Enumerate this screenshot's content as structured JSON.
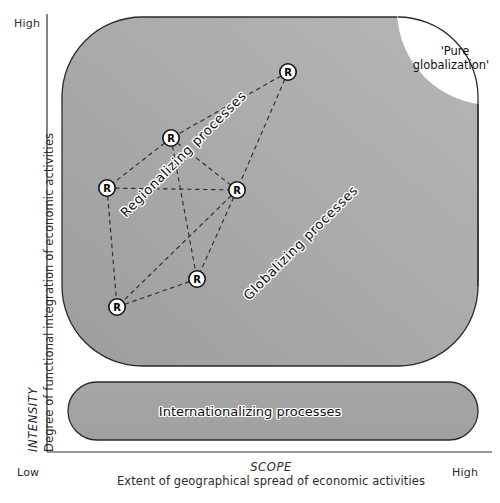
{
  "figure": {
    "background_color": "#ffffff",
    "shape_fill": "#a9a9a9",
    "shape_stroke": "#2b2b2b",
    "node_fill": "#ffffff",
    "node_stroke": "#111111",
    "edge_color": "#2e2e2e"
  },
  "axes": {
    "y": {
      "title_italic": "INTENSITY",
      "title_sub": "Degree of functional integration of economic activities",
      "high_label": "High",
      "low_label": "Low"
    },
    "x": {
      "title_italic": "SCOPE",
      "title_sub": "Extent of geographical spread of economic activities",
      "low_label": "Low",
      "high_label": "High"
    }
  },
  "regions": {
    "main_shape": {
      "label_globalizing": "Globalizing  processes",
      "label_regionalizing": "Regionalizing  processes",
      "pure_globalization_line1": "'Pure",
      "pure_globalization_line2": "globalization'"
    },
    "bottom_shape": {
      "label": "Internationalizing processes"
    }
  },
  "network": {
    "node_letter": "R",
    "node_count": 6,
    "nodes": [
      {
        "id": "r1",
        "letter": "R",
        "x": 288,
        "y": 72
      },
      {
        "id": "r2",
        "letter": "R",
        "x": 171,
        "y": 138
      },
      {
        "id": "r3",
        "letter": "R",
        "x": 107,
        "y": 188
      },
      {
        "id": "r4",
        "letter": "R",
        "x": 237,
        "y": 190
      },
      {
        "id": "r5",
        "letter": "R",
        "x": 197,
        "y": 279
      },
      {
        "id": "r6",
        "letter": "R",
        "x": 117,
        "y": 307
      }
    ],
    "edges": [
      [
        "r1",
        "r2"
      ],
      [
        "r1",
        "r4"
      ],
      [
        "r2",
        "r3"
      ],
      [
        "r2",
        "r4"
      ],
      [
        "r2",
        "r5"
      ],
      [
        "r3",
        "r4"
      ],
      [
        "r3",
        "r6"
      ],
      [
        "r4",
        "r5"
      ],
      [
        "r4",
        "r6"
      ],
      [
        "r5",
        "r6"
      ]
    ]
  }
}
